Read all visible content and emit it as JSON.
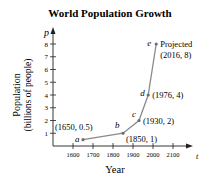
{
  "chart_data": {
    "type": "line",
    "title": "World Population Growth",
    "xlabel": "Year",
    "ylabel_line1": "Population",
    "ylabel_line2": "(billions of people)",
    "x_axis_var": "t",
    "y_axis_var": "p",
    "xlim": [
      1550,
      2150
    ],
    "ylim": [
      0,
      8.5
    ],
    "x_ticks": [
      1600,
      1700,
      1800,
      1900,
      2000,
      2100
    ],
    "y_ticks": [
      1,
      2,
      3,
      4,
      5,
      6,
      7,
      8
    ],
    "grid": false,
    "series": [
      {
        "name": "World population",
        "points": [
          {
            "label": "a",
            "x": 1650,
            "y": 0.5,
            "annotation": "(1650, 0.5)"
          },
          {
            "label": "b",
            "x": 1850,
            "y": 1,
            "annotation": "(1850, 1)"
          },
          {
            "label": "c",
            "x": 1930,
            "y": 2,
            "annotation": "(1930, 2)"
          },
          {
            "label": "d",
            "x": 1976,
            "y": 4,
            "annotation": "(1976, 4)"
          },
          {
            "label": "e",
            "x": 2016,
            "y": 8,
            "annotation": "(2016, 8)",
            "note": "Projected"
          }
        ]
      }
    ],
    "colors": {
      "line": "#8a8a8a",
      "text": "#231f20",
      "axis": "#231f20"
    }
  }
}
